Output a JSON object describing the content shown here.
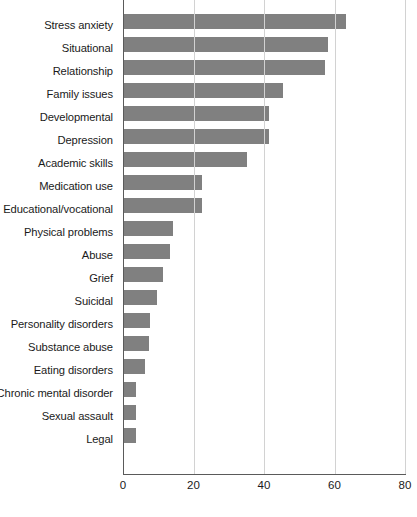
{
  "chart_data": {
    "type": "bar",
    "orientation": "horizontal",
    "title": "",
    "xlabel": "",
    "ylabel": "",
    "xlim": [
      0,
      80
    ],
    "xticks": [
      0,
      20,
      40,
      60,
      80
    ],
    "grid": true,
    "legend": false,
    "bar_color": "#808080",
    "gridline_color": "#d2d2d2",
    "axis_color": "#5a5a5a",
    "categories": [
      "Stress anxiety",
      "Situational",
      "Relationship",
      "Family issues",
      "Developmental",
      "Depression",
      "Academic skills",
      "Medication use",
      "Educational/vocational",
      "Physical problems",
      "Abuse",
      "Grief",
      "Suicidal",
      "Personality disorders",
      "Substance abuse",
      "Eating disorders",
      "Chronic mental disorder",
      "Sexual assault",
      "Legal"
    ],
    "values": [
      63,
      58,
      57,
      45,
      41,
      41,
      35,
      22,
      22,
      14,
      13,
      11,
      9.5,
      7.5,
      7,
      6,
      3.5,
      3.5,
      3.5
    ]
  },
  "axis": {
    "tick_labels": [
      "0",
      "20",
      "40",
      "60",
      "80"
    ]
  }
}
